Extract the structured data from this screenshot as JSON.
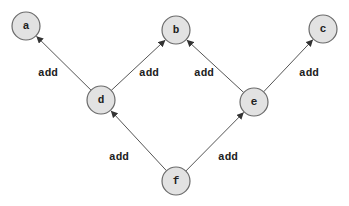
{
  "diagram": {
    "type": "directed-graph",
    "nodes": [
      {
        "id": "a",
        "label": "a",
        "x": 26,
        "y": 26
      },
      {
        "id": "b",
        "label": "b",
        "x": 176,
        "y": 30
      },
      {
        "id": "c",
        "label": "c",
        "x": 323,
        "y": 29
      },
      {
        "id": "d",
        "label": "d",
        "x": 101,
        "y": 100
      },
      {
        "id": "e",
        "label": "e",
        "x": 254,
        "y": 102
      },
      {
        "id": "f",
        "label": "f",
        "x": 176,
        "y": 181
      }
    ],
    "edges": [
      {
        "from": "d",
        "to": "a",
        "label": "add",
        "label_x": 48,
        "label_y": 73
      },
      {
        "from": "d",
        "to": "b",
        "label": "add",
        "label_x": 149,
        "label_y": 73
      },
      {
        "from": "e",
        "to": "b",
        "label": "add",
        "label_x": 204,
        "label_y": 73
      },
      {
        "from": "e",
        "to": "c",
        "label": "add",
        "label_x": 309,
        "label_y": 73
      },
      {
        "from": "f",
        "to": "d",
        "label": "add",
        "label_x": 119,
        "label_y": 157
      },
      {
        "from": "f",
        "to": "e",
        "label": "add",
        "label_x": 228,
        "label_y": 157
      }
    ],
    "node_radius": 14,
    "colors": {
      "node_fill": "#e2e2e2",
      "node_stroke": "#6a6a6a",
      "edge": "#555555",
      "text": "#222222",
      "background": "#ffffff"
    }
  }
}
